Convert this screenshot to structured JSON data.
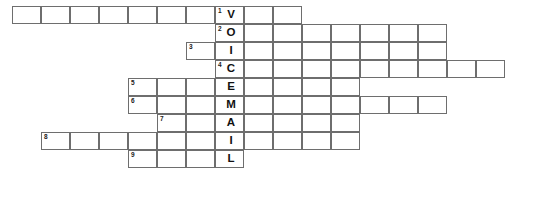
{
  "puzzle": {
    "title": "VOICEMAIL crossword grid",
    "keyword": "VOICEMAIL",
    "keyword_column": 7,
    "cell_width": 29,
    "cell_height": 18,
    "origin_x": 13,
    "origin_y": 7,
    "border_color": "#6e6e6e",
    "cell_fill": "#ffffff",
    "text_color": "#111111",
    "rows": [
      {
        "number": "1",
        "letter": "V",
        "row_index": 0,
        "start_col": 0,
        "end_col": 9,
        "number_col": 7,
        "length": 10
      },
      {
        "number": "2",
        "letter": "O",
        "row_index": 1,
        "start_col": 7,
        "end_col": 14,
        "number_col": 7,
        "length": 8
      },
      {
        "number": "3",
        "letter": "I",
        "row_index": 2,
        "start_col": 6,
        "end_col": 14,
        "number_col": 6,
        "length": 9
      },
      {
        "number": "4",
        "letter": "C",
        "row_index": 3,
        "start_col": 7,
        "end_col": 16,
        "number_col": 7,
        "length": 10
      },
      {
        "number": "5",
        "letter": "E",
        "row_index": 4,
        "start_col": 4,
        "end_col": 11,
        "number_col": 4,
        "length": 8
      },
      {
        "number": "6",
        "letter": "M",
        "row_index": 5,
        "start_col": 4,
        "end_col": 14,
        "number_col": 4,
        "length": 11
      },
      {
        "number": "7",
        "letter": "A",
        "row_index": 6,
        "start_col": 5,
        "end_col": 11,
        "number_col": 5,
        "length": 7
      },
      {
        "number": "8",
        "letter": "I",
        "row_index": 7,
        "start_col": 1,
        "end_col": 11,
        "number_col": 1,
        "length": 11
      },
      {
        "number": "9",
        "letter": "L",
        "row_index": 8,
        "start_col": 4,
        "end_col": 7,
        "number_col": 4,
        "length": 4
      }
    ]
  }
}
